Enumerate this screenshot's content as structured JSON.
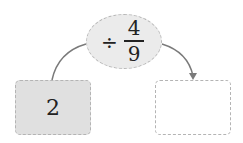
{
  "operation": {
    "symbol": "÷",
    "numerator": "4",
    "denominator": "9"
  },
  "input_box": {
    "value": "2"
  },
  "output_box": {
    "value": ""
  },
  "colors": {
    "oval_fill": "#ebebeb",
    "input_fill": "#e0e0e0",
    "output_fill": "#ffffff",
    "arrow": "#777777"
  }
}
